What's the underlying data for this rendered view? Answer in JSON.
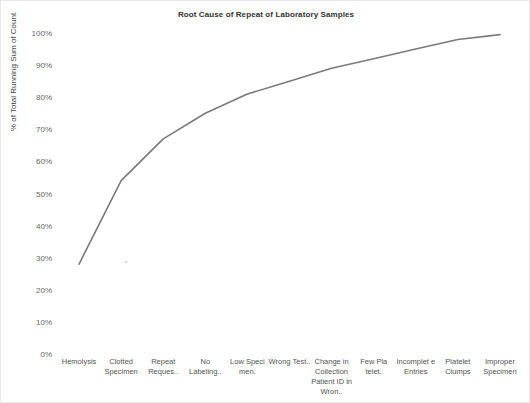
{
  "chart_data": {
    "type": "line",
    "title": "Root Cause of Repeat of Laboratory Samples",
    "xlabel": "",
    "ylabel": "% of Total Running Sum of Count",
    "categories": [
      "Hemolysis",
      "Clotted Specimen",
      "Repeat Reques..",
      "No Labeling..",
      "Low Speci men.",
      "Wrong Test..",
      "Change in Collection Patient ID  in Wron..",
      "Few Pla telet.",
      "Incomplet e Entries",
      "Platelet Clumps",
      "Improper Specimen"
    ],
    "values": [
      28,
      54,
      67,
      75,
      81,
      85,
      89,
      92,
      95,
      98,
      99.5
    ],
    "ytick_labels": [
      "0%",
      "10%",
      "20%",
      "30%",
      "40%",
      "50%",
      "60%",
      "70%",
      "80%",
      "90%",
      "100%"
    ],
    "ytick_values": [
      0,
      10,
      20,
      30,
      40,
      50,
      60,
      70,
      80,
      90,
      100
    ],
    "ylim": [
      0,
      100
    ],
    "grid": false,
    "legend": "none",
    "line_color": "#7a7a7a"
  }
}
